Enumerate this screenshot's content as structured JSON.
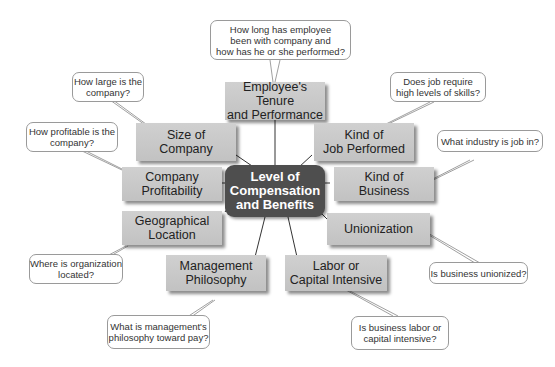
{
  "center": {
    "lines": [
      "Level of",
      "Compensation",
      "and Benefits"
    ],
    "bg": "#4e4e4e",
    "color": "#ffffff"
  },
  "factors": [
    {
      "id": "tenure",
      "lines": [
        "Employee's Tenure",
        "and Performance"
      ],
      "question": [
        "How long has employee",
        "been with company and",
        "how has he or she performed?"
      ]
    },
    {
      "id": "size",
      "lines": [
        "Size of",
        "Company"
      ],
      "question": [
        "How large is the",
        "company?"
      ]
    },
    {
      "id": "job",
      "lines": [
        "Kind of",
        "Job Performed"
      ],
      "question": [
        "Does job require",
        "high levels of skills?"
      ]
    },
    {
      "id": "profitability",
      "lines": [
        "Company",
        "Profitability"
      ],
      "question": [
        "How profitable is the",
        "company?"
      ]
    },
    {
      "id": "business",
      "lines": [
        "Kind of",
        "Business"
      ],
      "question": [
        "What industry is job in?"
      ]
    },
    {
      "id": "geography",
      "lines": [
        "Geographical",
        "Location"
      ],
      "question": [
        "Where is organization",
        "located?"
      ]
    },
    {
      "id": "union",
      "lines": [
        "Unionization"
      ],
      "question": [
        "Is business unionized?"
      ]
    },
    {
      "id": "management",
      "lines": [
        "Management",
        "Philosophy"
      ],
      "question": [
        "What is management's",
        "philosophy toward pay?"
      ]
    },
    {
      "id": "labor",
      "lines": [
        "Labor or",
        "Capital Intensive"
      ],
      "question": [
        "Is business labor or",
        "capital intensive?"
      ]
    }
  ],
  "colors": {
    "factor_box": "#c9c9c9",
    "bubble_border": "#9a9a9a",
    "connector": "#333333"
  }
}
